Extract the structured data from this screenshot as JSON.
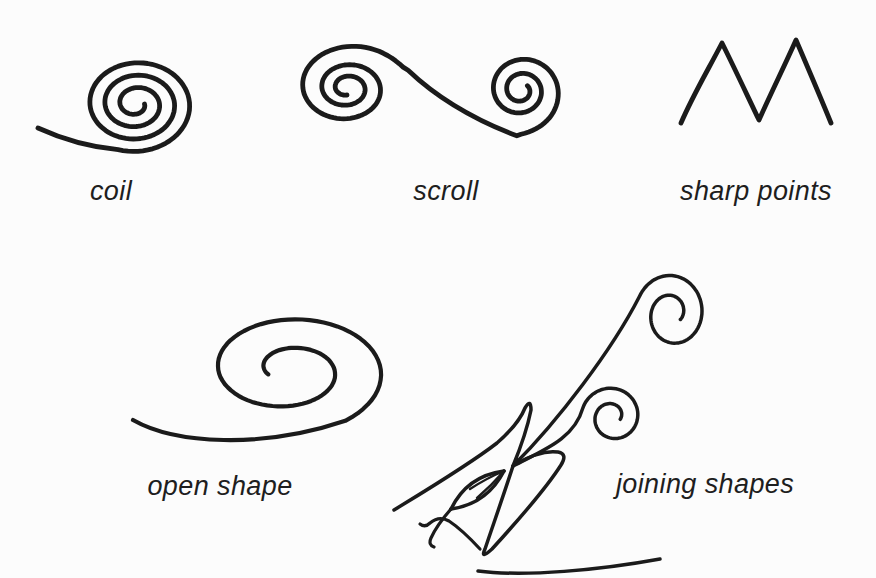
{
  "page": {
    "background_color": "#fcfcfc",
    "ink_color": "#1b1b1b",
    "label_color": "#1e1e1e"
  },
  "figures": [
    {
      "name": "coil",
      "label": "coil"
    },
    {
      "name": "scroll",
      "label": "scroll"
    },
    {
      "name": "sharp-points",
      "label": "sharp points"
    },
    {
      "name": "open-shape",
      "label": "open shape"
    },
    {
      "name": "joining-shapes",
      "label": "joining shapes"
    }
  ]
}
